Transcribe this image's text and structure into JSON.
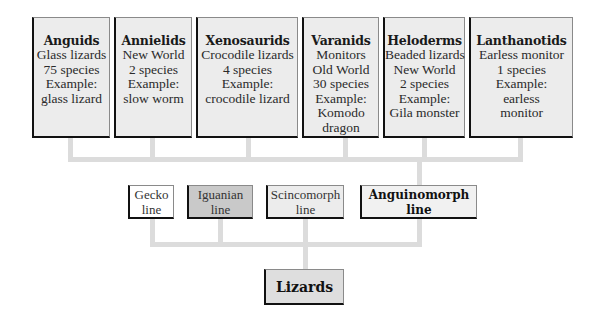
{
  "diagram": {
    "families": [
      {
        "title": "Anguids",
        "lines": [
          "Glass lizards",
          "75 species",
          "Example:",
          "glass lizard"
        ]
      },
      {
        "title": "Annielids",
        "lines": [
          "New World",
          "2 species",
          "Example:",
          "slow worm"
        ]
      },
      {
        "title": "Xenosaurids",
        "lines": [
          "Crocodile lizards",
          "4 species",
          "Example:",
          "crocodile lizard"
        ]
      },
      {
        "title": "Varanids",
        "lines": [
          "Monitors",
          "Old World",
          "30 species",
          "Example:",
          "Komodo",
          "dragon"
        ]
      },
      {
        "title": "Heloderms",
        "lines": [
          "Beaded lizards",
          "New World",
          "2 species",
          "Example:",
          "Gila monster"
        ]
      },
      {
        "title": "Lanthanotids",
        "lines": [
          "Earless monitor",
          "1 species",
          "Example:",
          "earless",
          "monitor"
        ]
      }
    ],
    "lines": [
      {
        "lines": [
          "Gecko",
          "line"
        ],
        "bg": "#ffffff"
      },
      {
        "lines": [
          "Iguanian",
          "line"
        ],
        "bg": "#c9c9c9"
      },
      {
        "lines": [
          "Scincomorph",
          "line"
        ],
        "bg": "#ececec"
      },
      {
        "lines": [
          "Anguinomorph",
          "line"
        ],
        "bg": "#f1f1f1",
        "bold": true
      }
    ],
    "root": {
      "title": "Lizards",
      "bg": "#dedede"
    },
    "colors": {
      "connector": "#dcdcdc",
      "box_border": "#111111",
      "box_bg": "#ececec"
    }
  }
}
